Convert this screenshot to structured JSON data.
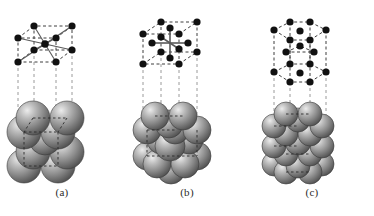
{
  "figure": {
    "background_color": "#ffffff",
    "panel_count": 3
  },
  "style": {
    "node_color": "#111111",
    "edge_dashed_color": "#4a4a4a",
    "bond_solid_color": "#555555",
    "projection_line_color": "#9a9a9a",
    "sphere_light": "#e8e8e8",
    "sphere_mid": "#9c9c9c",
    "sphere_dark": "#4c4c4c",
    "sphere_edge": "#3a3a3a",
    "caption_color": "#2b2b2b"
  },
  "panels": [
    {
      "id": "a",
      "caption": "(a)",
      "structure_name": "body-centered cubic",
      "abbreviation": "bcc",
      "lattice_nodes": 9,
      "corner_nodes": 8,
      "interior_nodes": 1,
      "coordination_number": 8,
      "sphere_count": 9,
      "sphere_radius": 17,
      "projection_lines": 4,
      "cell": {
        "front": [
          [
            18,
            62
          ],
          [
            18,
            38
          ],
          [
            56,
            38
          ],
          [
            56,
            62
          ]
        ],
        "back": [
          [
            34,
            50
          ],
          [
            34,
            26
          ],
          [
            72,
            26
          ],
          [
            72,
            50
          ]
        ],
        "center": [
          45,
          44
        ]
      },
      "bond_targets": [
        [
          18,
          62
        ],
        [
          18,
          38
        ],
        [
          56,
          38
        ],
        [
          56,
          62
        ],
        [
          34,
          50
        ],
        [
          34,
          26
        ],
        [
          72,
          26
        ],
        [
          72,
          50
        ]
      ],
      "projection_x": [
        18,
        34,
        56,
        72
      ],
      "projection_y_top": 62,
      "projection_y_bottom": 104,
      "spheres": [
        {
          "cx": 33,
          "cy": 118,
          "r": 17,
          "z": 1
        },
        {
          "cx": 67,
          "cy": 118,
          "r": 17,
          "z": 1
        },
        {
          "cx": 24,
          "cy": 132,
          "r": 17,
          "z": 2
        },
        {
          "cx": 58,
          "cy": 132,
          "r": 17,
          "z": 2
        },
        {
          "cx": 45,
          "cy": 139,
          "r": 16,
          "z": 3
        },
        {
          "cx": 33,
          "cy": 152,
          "r": 17,
          "z": 4
        },
        {
          "cx": 67,
          "cy": 152,
          "r": 17,
          "z": 4
        },
        {
          "cx": 24,
          "cy": 166,
          "r": 17,
          "z": 5
        },
        {
          "cx": 58,
          "cy": 166,
          "r": 17,
          "z": 5
        }
      ]
    },
    {
      "id": "b",
      "caption": "(b)",
      "structure_name": "face-centered cubic",
      "abbreviation": "fcc",
      "lattice_nodes": 14,
      "corner_nodes": 8,
      "face_nodes": 6,
      "coordination_number": 12,
      "sphere_count": 14,
      "sphere_radius": 14,
      "projection_lines": 4,
      "cell": {
        "front": [
          [
            18,
            64
          ],
          [
            18,
            34
          ],
          [
            54,
            34
          ],
          [
            54,
            64
          ]
        ],
        "back": [
          [
            36,
            52
          ],
          [
            36,
            22
          ],
          [
            72,
            22
          ],
          [
            72,
            52
          ]
        ],
        "center": [
          45,
          43
        ]
      },
      "bond_targets": [
        [
          45,
          28
        ],
        [
          45,
          58
        ],
        [
          27,
          43
        ],
        [
          63,
          43
        ],
        [
          36,
          37
        ],
        [
          54,
          49
        ]
      ],
      "projection_x": [
        18,
        36,
        54,
        72
      ],
      "projection_y_top": 64,
      "projection_y_bottom": 104,
      "spheres": [
        {
          "cx": 30,
          "cy": 116,
          "r": 14,
          "z": 1
        },
        {
          "cx": 58,
          "cy": 116,
          "r": 14,
          "z": 1
        },
        {
          "cx": 44,
          "cy": 124,
          "r": 14,
          "z": 2
        },
        {
          "cx": 22,
          "cy": 130,
          "r": 14,
          "z": 2
        },
        {
          "cx": 50,
          "cy": 130,
          "r": 14,
          "z": 2
        },
        {
          "cx": 72,
          "cy": 130,
          "r": 14,
          "z": 2
        },
        {
          "cx": 36,
          "cy": 140,
          "r": 14,
          "z": 3
        },
        {
          "cx": 64,
          "cy": 140,
          "r": 14,
          "z": 3
        },
        {
          "cx": 45,
          "cy": 146,
          "r": 15,
          "z": 4
        },
        {
          "cx": 22,
          "cy": 156,
          "r": 14,
          "z": 5
        },
        {
          "cx": 72,
          "cy": 156,
          "r": 14,
          "z": 5
        },
        {
          "cx": 32,
          "cy": 164,
          "r": 14,
          "z": 5
        },
        {
          "cx": 60,
          "cy": 164,
          "r": 14,
          "z": 5
        },
        {
          "cx": 46,
          "cy": 170,
          "r": 14,
          "z": 6
        }
      ]
    },
    {
      "id": "c",
      "caption": "(c)",
      "structure_name": "hexagonal close-packed",
      "abbreviation": "hcp",
      "lattice_nodes": 17,
      "top_layer_nodes": 7,
      "middle_layer_nodes": 3,
      "bottom_layer_nodes": 7,
      "coordination_number": 12,
      "sphere_count": 17,
      "sphere_radius": 12,
      "projection_lines": 4,
      "cell": {
        "top_hex": [
          [
            24,
            30
          ],
          [
            40,
            22
          ],
          [
            60,
            22
          ],
          [
            76,
            30
          ],
          [
            60,
            40
          ],
          [
            40,
            40
          ]
        ],
        "bottom_hex": [
          [
            24,
            72
          ],
          [
            40,
            64
          ],
          [
            60,
            64
          ],
          [
            76,
            72
          ],
          [
            60,
            82
          ],
          [
            40,
            82
          ]
        ],
        "top_center": [
          50,
          31
        ],
        "bottom_center": [
          50,
          73
        ],
        "middle": [
          [
            36,
            52
          ],
          [
            50,
            46
          ],
          [
            64,
            52
          ]
        ]
      },
      "projection_x": [
        24,
        40,
        60,
        76
      ],
      "projection_y_top": 82,
      "projection_y_bottom": 104,
      "spheres": [
        {
          "cx": 36,
          "cy": 114,
          "r": 12,
          "z": 1
        },
        {
          "cx": 60,
          "cy": 114,
          "r": 12,
          "z": 1
        },
        {
          "cx": 48,
          "cy": 120,
          "r": 12,
          "z": 2
        },
        {
          "cx": 24,
          "cy": 126,
          "r": 12,
          "z": 2
        },
        {
          "cx": 72,
          "cy": 126,
          "r": 12,
          "z": 2
        },
        {
          "cx": 36,
          "cy": 134,
          "r": 12,
          "z": 3
        },
        {
          "cx": 60,
          "cy": 134,
          "r": 12,
          "z": 3
        },
        {
          "cx": 48,
          "cy": 142,
          "r": 13,
          "z": 4
        },
        {
          "cx": 24,
          "cy": 146,
          "r": 12,
          "z": 4
        },
        {
          "cx": 72,
          "cy": 146,
          "r": 12,
          "z": 4
        },
        {
          "cx": 36,
          "cy": 154,
          "r": 12,
          "z": 5
        },
        {
          "cx": 60,
          "cy": 154,
          "r": 12,
          "z": 5
        },
        {
          "cx": 24,
          "cy": 164,
          "r": 12,
          "z": 6
        },
        {
          "cx": 72,
          "cy": 164,
          "r": 12,
          "z": 6
        },
        {
          "cx": 36,
          "cy": 172,
          "r": 12,
          "z": 6
        },
        {
          "cx": 60,
          "cy": 172,
          "r": 12,
          "z": 6
        },
        {
          "cx": 48,
          "cy": 166,
          "r": 12,
          "z": 7
        }
      ]
    }
  ]
}
